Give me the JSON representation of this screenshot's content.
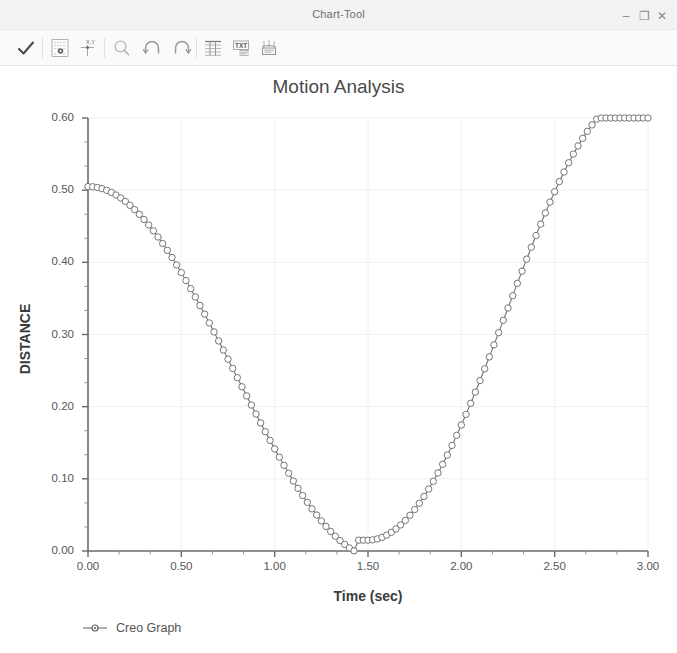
{
  "window": {
    "title": "Chart-Tool",
    "minimize_label": "–",
    "maximize_label": "❐",
    "close_label": "✕"
  },
  "toolbar": {
    "buttons": [
      {
        "name": "accept-check-icon",
        "tooltip": "Accept"
      },
      {
        "name": "graph-settings-icon",
        "tooltip": "Graph Settings"
      },
      {
        "name": "xy-axis-icon",
        "tooltip": "Axis Definition"
      },
      {
        "name": "zoom-magnifier-icon",
        "tooltip": "Zoom"
      },
      {
        "name": "undo-arrow-icon",
        "tooltip": "Undo"
      },
      {
        "name": "redo-arrow-icon",
        "tooltip": "Redo"
      },
      {
        "name": "table-grid-icon",
        "tooltip": "Show Table"
      },
      {
        "name": "text-format-icon",
        "tooltip": "Text Format"
      },
      {
        "name": "export-save-icon",
        "tooltip": "Export"
      }
    ]
  },
  "chart_data": {
    "type": "line",
    "title": "Motion Analysis",
    "xlabel": "Time (sec)",
    "ylabel": "DISTANCE",
    "xlim": [
      0.0,
      3.0
    ],
    "ylim": [
      0.0,
      0.6
    ],
    "xticks": [
      0.0,
      0.5,
      1.0,
      1.5,
      2.0,
      2.5,
      3.0
    ],
    "xtick_labels": [
      "0.00",
      "0.50",
      "1.00",
      "1.50",
      "2.00",
      "2.50",
      "3.00"
    ],
    "yticks": [
      0.0,
      0.1,
      0.2,
      0.3,
      0.4,
      0.5,
      0.6
    ],
    "ytick_labels": [
      "0.00",
      "0.10",
      "0.20",
      "0.30",
      "0.40",
      "0.50",
      "0.60"
    ],
    "x_minor_per_major": 2,
    "y_minor_per_major": 2,
    "grid": true,
    "grid_color": "#eef0f4",
    "legend_position": "bottom-left",
    "marker": "open-circle",
    "marker_size": 3.2,
    "line_color": "#6f6f6f",
    "marker_color": "#6f6f6f",
    "series": [
      {
        "name": "Creo Graph",
        "n_points": 121,
        "formula": "y = 0.2615 + 0.2435*cos(2*pi*x/3)",
        "x": [
          0.0,
          0.025,
          0.05,
          0.075,
          0.1,
          0.125,
          0.15,
          0.175,
          0.2,
          0.225,
          0.25,
          0.275,
          0.3,
          0.325,
          0.35,
          0.375,
          0.4,
          0.425,
          0.45,
          0.475,
          0.5,
          0.525,
          0.55,
          0.575,
          0.6,
          0.625,
          0.65,
          0.675,
          0.7,
          0.725,
          0.75,
          0.775,
          0.8,
          0.825,
          0.85,
          0.875,
          0.9,
          0.925,
          0.95,
          0.975,
          1.0,
          1.025,
          1.05,
          1.075,
          1.1,
          1.125,
          1.15,
          1.175,
          1.2,
          1.225,
          1.25,
          1.275,
          1.3,
          1.325,
          1.35,
          1.375,
          1.4,
          1.425,
          1.45,
          1.475,
          1.5,
          1.525,
          1.55,
          1.575,
          1.6,
          1.625,
          1.65,
          1.675,
          1.7,
          1.725,
          1.75,
          1.775,
          1.8,
          1.825,
          1.85,
          1.875,
          1.9,
          1.925,
          1.95,
          1.975,
          2.0,
          2.025,
          2.05,
          2.075,
          2.1,
          2.125,
          2.15,
          2.175,
          2.2,
          2.225,
          2.25,
          2.275,
          2.3,
          2.325,
          2.35,
          2.375,
          2.4,
          2.425,
          2.45,
          2.475,
          2.5,
          2.525,
          2.55,
          2.575,
          2.6,
          2.625,
          2.65,
          2.675,
          2.7,
          2.725,
          2.75,
          2.775,
          2.8,
          2.825,
          2.85,
          2.875,
          2.9,
          2.925,
          2.95,
          2.975,
          3.0
        ],
        "y": [
          0.505,
          0.5047,
          0.5037,
          0.5021,
          0.4998,
          0.4969,
          0.4933,
          0.4892,
          0.4844,
          0.479,
          0.473,
          0.4665,
          0.4594,
          0.4518,
          0.4437,
          0.4351,
          0.4261,
          0.4166,
          0.4067,
          0.3964,
          0.3858,
          0.3748,
          0.3635,
          0.352,
          0.3402,
          0.3282,
          0.316,
          0.3036,
          0.2911,
          0.2785,
          0.2658,
          0.253,
          0.2403,
          0.2276,
          0.2149,
          0.2023,
          0.1898,
          0.1775,
          0.1653,
          0.1533,
          0.1415,
          0.13,
          0.1187,
          0.1077,
          0.0971,
          0.0868,
          0.0769,
          0.0674,
          0.0584,
          0.0498,
          0.0417,
          0.0341,
          0.027,
          0.0205,
          0.0145,
          0.0091,
          0.0043,
          0.0002,
          -0.0034,
          -0.0063,
          0.015,
          0.0155,
          0.0168,
          0.019,
          0.022,
          0.0259,
          0.0306,
          0.0361,
          0.0424,
          0.0496,
          0.0575,
          0.0662,
          0.0756,
          0.0858,
          0.0966,
          0.1081,
          0.1202,
          0.133,
          0.1463,
          0.1602,
          0.1745,
          0.1893,
          0.2046,
          0.2202,
          0.2362,
          0.2525,
          0.269,
          0.2857,
          0.3026,
          0.3196,
          0.3367,
          0.3538,
          0.3708,
          0.3877,
          0.4044,
          0.4209,
          0.4371,
          0.4529,
          0.4684,
          0.4834,
          0.4979,
          0.5119,
          0.5252,
          0.538,
          0.55,
          0.5613,
          0.5718,
          0.5815,
          0.5904,
          0.5984,
          0.6055,
          0.6116,
          0.6168,
          0.621,
          0.6242,
          0.6264,
          0.6276,
          0.6278,
          0.627,
          0.6252,
          0.6224
        ]
      }
    ],
    "legend": [
      {
        "label": "Creo Graph",
        "marker": "open-circle",
        "color": "#6f6f6f"
      }
    ]
  }
}
